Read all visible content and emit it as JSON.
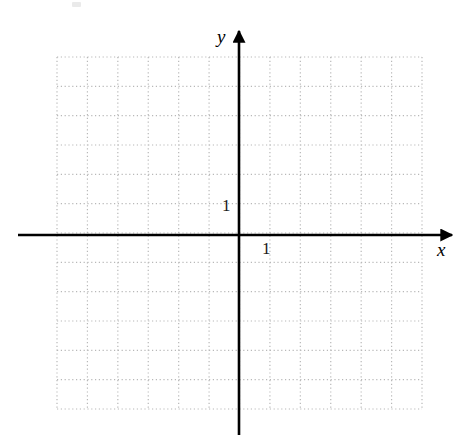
{
  "figure": {
    "kind": "coordinate-grid",
    "background_color": "#ffffff",
    "width": 464,
    "height": 440
  },
  "labels": {
    "x_axis": "x",
    "y_axis": "y",
    "x_tick_one": "1",
    "y_tick_one": "1"
  },
  "colors": {
    "axis": "#000000",
    "grid": "#b8b8b8",
    "text": "#000000",
    "background": "#ffffff"
  },
  "chart_data": {
    "type": "scatter",
    "title": "",
    "subtitle": "",
    "xlabel": "x",
    "ylabel": "y",
    "xlim": [
      -6,
      6
    ],
    "ylim": [
      -6,
      6
    ],
    "xticks": [
      -6,
      -5,
      -4,
      -3,
      -2,
      -1,
      0,
      1,
      2,
      3,
      4,
      5,
      6
    ],
    "yticks": [
      -6,
      -5,
      -4,
      -3,
      -2,
      -1,
      0,
      1,
      2,
      3,
      4,
      5,
      6
    ],
    "xtick_labels": [
      "",
      "",
      "",
      "",
      "",
      "",
      "",
      "1",
      "",
      "",
      "",
      "",
      ""
    ],
    "ytick_labels": [
      "",
      "",
      "",
      "",
      "",
      "",
      "",
      "1",
      "",
      "",
      "",
      "",
      ""
    ],
    "grid": true,
    "grid_style": "dotted",
    "grid_columns": 12,
    "grid_rows": 12,
    "grid_spacing_units": 1,
    "legend": null,
    "legend_position": "none",
    "series": [],
    "annotations": [
      {
        "text": "y",
        "x": -0.05,
        "y": 6.6,
        "style": "italic"
      },
      {
        "text": "x",
        "x": 6.6,
        "y": -0.4,
        "style": "italic"
      },
      {
        "text": "1",
        "x": -0.55,
        "y": 1.0,
        "style": "upright"
      },
      {
        "text": "1",
        "x": 0.8,
        "y": -0.45,
        "style": "upright"
      }
    ],
    "axis_arrows": {
      "x_positive": true,
      "y_positive": true
    }
  },
  "geometry": {
    "origin_x": 239,
    "origin_y": 235,
    "cell_width": 30.4,
    "cell_height": 29.3,
    "grid_left": 57,
    "grid_right": 422,
    "grid_top": 57,
    "grid_bottom": 409,
    "x_axis_start": 18,
    "x_axis_end": 452,
    "y_axis_start": 31,
    "y_axis_end": 435
  }
}
